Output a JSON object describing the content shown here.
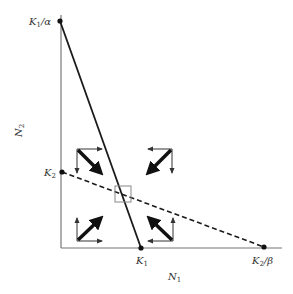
{
  "diagram": {
    "type": "phase-plane",
    "axes": {
      "x_label": "N",
      "x_label_sub": "1",
      "y_label": "N",
      "y_label_sub": "2"
    },
    "points": {
      "k1_over_alpha": {
        "base": "K",
        "sub": "1",
        "suffix": "/α"
      },
      "k2": {
        "base": "K",
        "sub": "2",
        "suffix": ""
      },
      "k1": {
        "base": "K",
        "sub": "1",
        "suffix": ""
      },
      "k2_over_beta": {
        "base": "K",
        "sub": "2",
        "suffix": "/β"
      }
    },
    "isoclines": [
      {
        "name": "N1 isocline",
        "style": "solid",
        "from": "K1/α",
        "to": "K1"
      },
      {
        "name": "N2 isocline",
        "style": "dashed",
        "from": "K2",
        "to": "K2/β"
      }
    ],
    "equilibrium_marker": "box at isocline intersection",
    "vector_groups": [
      {
        "region": "upper-left",
        "n1": "increase",
        "n2": "decrease",
        "resultant": "down-right"
      },
      {
        "region": "upper-right",
        "n1": "decrease",
        "n2": "decrease",
        "resultant": "down-left"
      },
      {
        "region": "lower-left",
        "n1": "increase",
        "n2": "increase",
        "resultant": "up-right"
      },
      {
        "region": "lower-right",
        "n1": "decrease",
        "n2": "increase",
        "resultant": "up-left"
      }
    ],
    "colors": {
      "axis": "#777777",
      "line": "#1a1a1a",
      "box": "#888888",
      "text": "#333333"
    }
  }
}
